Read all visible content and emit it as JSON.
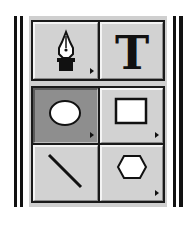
{
  "toolbox": {
    "title": "Drawing tools palette",
    "colors": {
      "panel": "#cfcfcf",
      "button": "#d2d2d2",
      "selected_button": "#8e8e8e",
      "border": "#1a1a1a"
    },
    "groups": [
      {
        "tools": [
          {
            "name": "pen-tool",
            "icon": "pen-nib-icon",
            "has_flyout": true,
            "selected": false
          },
          {
            "name": "text-tool",
            "icon": "text-icon",
            "glyph": "T",
            "has_flyout": false,
            "selected": false
          }
        ]
      },
      {
        "tools": [
          {
            "name": "ellipse-tool",
            "icon": "ellipse-icon",
            "has_flyout": true,
            "selected": true
          },
          {
            "name": "rectangle-tool",
            "icon": "rectangle-icon",
            "has_flyout": true,
            "selected": false
          },
          {
            "name": "line-tool",
            "icon": "line-icon",
            "has_flyout": false,
            "selected": false
          },
          {
            "name": "polygon-tool",
            "icon": "polygon-icon",
            "has_flyout": true,
            "selected": false
          }
        ]
      }
    ]
  }
}
